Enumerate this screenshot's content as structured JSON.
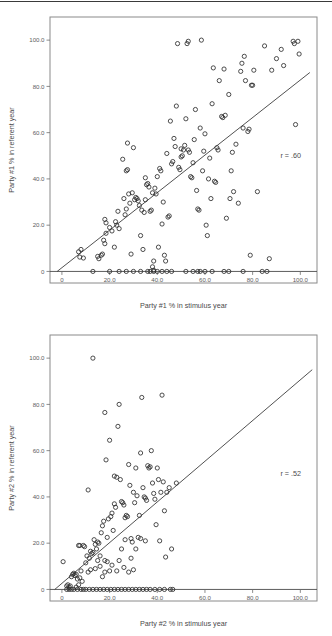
{
  "page": {
    "rule_visible": true
  },
  "chart_data": [
    {
      "id": "chart1",
      "type": "scatter",
      "title": "",
      "xlabel": "Party #1 % in stimulus year",
      "ylabel": "Party #1 % in referent year",
      "annotation": "r = .60",
      "correlation": 0.6,
      "xlim": [
        -5,
        107
      ],
      "ylim": [
        -5,
        110
      ],
      "xticks": [
        0,
        20,
        40,
        60,
        80,
        100
      ],
      "xticklabels": [
        "0",
        "20.0",
        "40.0",
        "60.0",
        "80.0",
        "100.0"
      ],
      "yticks": [
        0,
        20,
        40,
        60,
        80,
        100
      ],
      "yticklabels": [
        "0",
        "20.0",
        "40.0",
        "60.0",
        "80.0",
        "100.0"
      ],
      "grid": false,
      "legend": "none",
      "fit_line": {
        "x0": -2.0,
        "y0": 0.0,
        "x1": 104.0,
        "y1": 86.0
      },
      "marker": "open-circle",
      "points": [
        [
          7.0,
          8.5
        ],
        [
          7.5,
          6.2
        ],
        [
          8.0,
          9.5
        ],
        [
          9.0,
          5.8
        ],
        [
          15.0,
          6.5
        ],
        [
          15.5,
          5.5
        ],
        [
          16.5,
          7.0
        ],
        [
          17.0,
          7.5
        ],
        [
          17.5,
          13.5
        ],
        [
          18.0,
          12.0
        ],
        [
          18.5,
          16.5
        ],
        [
          18.0,
          22.5
        ],
        [
          18.5,
          21.0
        ],
        [
          20.0,
          19.0
        ],
        [
          21.0,
          17.5
        ],
        [
          22.0,
          10.5
        ],
        [
          22.5,
          21.5
        ],
        [
          23.0,
          20.0
        ],
        [
          23.5,
          26.0
        ],
        [
          24.0,
          18.5
        ],
        [
          25.5,
          48.5
        ],
        [
          26.0,
          31.5
        ],
        [
          26.5,
          24.5
        ],
        [
          27.0,
          27.0
        ],
        [
          27.5,
          55.5
        ],
        [
          27.0,
          43.5
        ],
        [
          27.5,
          44.0
        ],
        [
          28.0,
          33.5
        ],
        [
          28.5,
          29.5
        ],
        [
          29.0,
          7.5
        ],
        [
          29.5,
          34.0
        ],
        [
          30.0,
          53.5
        ],
        [
          30.5,
          31.0
        ],
        [
          31.0,
          32.0
        ],
        [
          31.5,
          31.5
        ],
        [
          32.0,
          30.5
        ],
        [
          32.5,
          28.5
        ],
        [
          33.0,
          15.5
        ],
        [
          33.5,
          26.5
        ],
        [
          34.0,
          9.5
        ],
        [
          34.5,
          25.5
        ],
        [
          35.0,
          40.5
        ],
        [
          35.5,
          37.5
        ],
        [
          35.0,
          31.0
        ],
        [
          36.0,
          38.0
        ],
        [
          36.5,
          36.5
        ],
        [
          37.0,
          26.0
        ],
        [
          37.5,
          26.5
        ],
        [
          38.0,
          34.0
        ],
        [
          38.5,
          4.5
        ],
        [
          38.0,
          2.0
        ],
        [
          38.5,
          0.5
        ],
        [
          39.0,
          36.0
        ],
        [
          39.5,
          33.5
        ],
        [
          40.0,
          41.0
        ],
        [
          40.5,
          10.5
        ],
        [
          41.0,
          44.5
        ],
        [
          41.5,
          43.5
        ],
        [
          42.0,
          20.5
        ],
        [
          42.5,
          30.0
        ],
        [
          43.0,
          7.0
        ],
        [
          43.5,
          4.5
        ],
        [
          44.0,
          51.0
        ],
        [
          44.5,
          23.5
        ],
        [
          45.0,
          24.0
        ],
        [
          45.5,
          65.0
        ],
        [
          46.0,
          46.5
        ],
        [
          46.5,
          47.5
        ],
        [
          47.0,
          57.5
        ],
        [
          47.5,
          54.0
        ],
        [
          48.0,
          71.5
        ],
        [
          48.5,
          98.5
        ],
        [
          49.0,
          45.0
        ],
        [
          49.5,
          44.0
        ],
        [
          50.0,
          53.0
        ],
        [
          50.5,
          50.0
        ],
        [
          50.0,
          49.5
        ],
        [
          51.0,
          52.5
        ],
        [
          51.5,
          54.5
        ],
        [
          52.0,
          66.0
        ],
        [
          52.5,
          98.5
        ],
        [
          53.0,
          99.5
        ],
        [
          53.5,
          51.5
        ],
        [
          53.0,
          52.5
        ],
        [
          54.0,
          41.0
        ],
        [
          54.5,
          40.5
        ],
        [
          55.0,
          47.0
        ],
        [
          55.5,
          57.0
        ],
        [
          56.0,
          70.0
        ],
        [
          56.5,
          35.0
        ],
        [
          57.0,
          27.0
        ],
        [
          57.5,
          26.5
        ],
        [
          58.0,
          62.0
        ],
        [
          58.5,
          100.0
        ],
        [
          59.0,
          43.5
        ],
        [
          59.5,
          52.0
        ],
        [
          60.0,
          59.5
        ],
        [
          60.5,
          20.0
        ],
        [
          61.0,
          15.5
        ],
        [
          61.5,
          40.0
        ],
        [
          62.0,
          49.0
        ],
        [
          62.5,
          31.5
        ],
        [
          63.0,
          72.5
        ],
        [
          63.5,
          88.0
        ],
        [
          64.0,
          39.0
        ],
        [
          64.5,
          38.5
        ],
        [
          65.0,
          53.5
        ],
        [
          65.5,
          52.5
        ],
        [
          66.0,
          82.5
        ],
        [
          67.0,
          67.0
        ],
        [
          67.5,
          66.5
        ],
        [
          68.0,
          87.5
        ],
        [
          68.5,
          67.5
        ],
        [
          69.0,
          23.0
        ],
        [
          70.0,
          76.5
        ],
        [
          70.5,
          31.5
        ],
        [
          71.0,
          43.5
        ],
        [
          71.5,
          51.5
        ],
        [
          72.0,
          34.5
        ],
        [
          73.0,
          55.0
        ],
        [
          74.0,
          29.5
        ],
        [
          75.0,
          86.5
        ],
        [
          75.5,
          90.0
        ],
        [
          76.0,
          62.0
        ],
        [
          76.5,
          93.0
        ],
        [
          77.0,
          82.5
        ],
        [
          78.0,
          60.5
        ],
        [
          78.5,
          61.5
        ],
        [
          79.5,
          80.5
        ],
        [
          80.0,
          80.5
        ],
        [
          80.5,
          87.0
        ],
        [
          82.0,
          34.5
        ],
        [
          79.0,
          7.0
        ],
        [
          85.0,
          97.5
        ],
        [
          87.0,
          5.5
        ],
        [
          88.0,
          87.0
        ],
        [
          90.0,
          92.0
        ],
        [
          92.0,
          96.0
        ],
        [
          93.0,
          89.0
        ],
        [
          97.0,
          99.5
        ],
        [
          97.5,
          98.5
        ],
        [
          99.0,
          99.5
        ],
        [
          99.5,
          94.0
        ],
        [
          98.0,
          63.5
        ],
        [
          24.0,
          0.0
        ],
        [
          27.0,
          0.0
        ],
        [
          30.0,
          0.0
        ],
        [
          33.0,
          0.0
        ],
        [
          36.0,
          0.0
        ],
        [
          37.0,
          0.0
        ],
        [
          38.5,
          0.0
        ],
        [
          40.0,
          0.0
        ],
        [
          42.0,
          0.0
        ],
        [
          44.0,
          0.0
        ],
        [
          46.0,
          0.0
        ],
        [
          52.0,
          0.0
        ],
        [
          55.0,
          0.0
        ],
        [
          57.0,
          0.0
        ],
        [
          58.0,
          0.0
        ],
        [
          60.0,
          0.0
        ],
        [
          63.0,
          0.0
        ],
        [
          68.0,
          0.0
        ],
        [
          70.0,
          0.0
        ],
        [
          76.0,
          0.0
        ],
        [
          84.0,
          0.0
        ],
        [
          86.0,
          0.0
        ],
        [
          13.0,
          0.0
        ],
        [
          20.0,
          0.0
        ]
      ]
    },
    {
      "id": "chart2",
      "type": "scatter",
      "title": "",
      "xlabel": "Party #2 % in stimulus year",
      "ylabel": "Party #2 % in referent year",
      "annotation": "r = .52",
      "correlation": 0.52,
      "xlim": [
        -5,
        107
      ],
      "ylim": [
        -5,
        110
      ],
      "xticks": [
        0,
        20,
        40,
        60,
        80,
        100
      ],
      "xticklabels": [
        "0",
        "20.0",
        "40.0",
        "60.0",
        "80.0",
        "100.0"
      ],
      "yticks": [
        0,
        20,
        40,
        60,
        80,
        100
      ],
      "yticklabels": [
        "0",
        "20.0",
        "40.0",
        "60.0",
        "80.0",
        "100.0"
      ],
      "grid": false,
      "legend": "none",
      "fit_line": {
        "x0": -3.0,
        "y0": 0.0,
        "x1": 105.0,
        "y1": 95.0
      },
      "marker": "open-circle",
      "points": [
        [
          0.5,
          12.0
        ],
        [
          2.0,
          1.5
        ],
        [
          2.5,
          2.0
        ],
        [
          3.0,
          1.0
        ],
        [
          3.5,
          1.5
        ],
        [
          4.0,
          5.5
        ],
        [
          4.5,
          6.5
        ],
        [
          5.0,
          7.0
        ],
        [
          5.5,
          6.0
        ],
        [
          6.0,
          6.5
        ],
        [
          6.5,
          4.5
        ],
        [
          7.0,
          19.0
        ],
        [
          7.5,
          19.0
        ],
        [
          7.5,
          5.0
        ],
        [
          8.0,
          8.0
        ],
        [
          8.5,
          3.5
        ],
        [
          9.0,
          19.0
        ],
        [
          9.5,
          18.5
        ],
        [
          10.0,
          11.5
        ],
        [
          10.5,
          14.5
        ],
        [
          11.0,
          43.0
        ],
        [
          11.5,
          13.5
        ],
        [
          12.0,
          16.5
        ],
        [
          12.5,
          15.5
        ],
        [
          13.0,
          16.0
        ],
        [
          13.5,
          21.5
        ],
        [
          13.0,
          100.0
        ],
        [
          14.0,
          19.5
        ],
        [
          14.5,
          17.5
        ],
        [
          15.0,
          20.5
        ],
        [
          15.5,
          20.0
        ],
        [
          16.0,
          14.5
        ],
        [
          16.5,
          24.5
        ],
        [
          17.0,
          27.5
        ],
        [
          17.5,
          29.5
        ],
        [
          17.0,
          5.5
        ],
        [
          18.0,
          76.5
        ],
        [
          18.5,
          56.0
        ],
        [
          18.0,
          7.5
        ],
        [
          19.0,
          22.5
        ],
        [
          19.5,
          30.5
        ],
        [
          20.0,
          64.5
        ],
        [
          20.5,
          31.5
        ],
        [
          21.0,
          33.0
        ],
        [
          21.5,
          25.5
        ],
        [
          22.0,
          37.0
        ],
        [
          22.5,
          35.5
        ],
        [
          22.0,
          49.0
        ],
        [
          23.0,
          48.5
        ],
        [
          23.5,
          70.5
        ],
        [
          24.0,
          80.0
        ],
        [
          24.5,
          47.5
        ],
        [
          25.0,
          38.0
        ],
        [
          25.5,
          37.5
        ],
        [
          26.0,
          36.5
        ],
        [
          26.5,
          31.0
        ],
        [
          27.0,
          32.0
        ],
        [
          27.5,
          31.5
        ],
        [
          28.0,
          54.0
        ],
        [
          28.5,
          45.0
        ],
        [
          29.0,
          22.0
        ],
        [
          29.5,
          20.5
        ],
        [
          30.0,
          42.0
        ],
        [
          30.5,
          37.5
        ],
        [
          31.0,
          52.5
        ],
        [
          31.5,
          40.5
        ],
        [
          32.0,
          22.5
        ],
        [
          32.5,
          32.0
        ],
        [
          33.0,
          59.0
        ],
        [
          33.5,
          83.0
        ],
        [
          34.0,
          44.0
        ],
        [
          34.5,
          40.0
        ],
        [
          35.0,
          39.5
        ],
        [
          35.5,
          38.5
        ],
        [
          36.0,
          53.5
        ],
        [
          36.5,
          52.5
        ],
        [
          37.0,
          53.0
        ],
        [
          37.5,
          60.0
        ],
        [
          38.0,
          46.0
        ],
        [
          38.5,
          41.5
        ],
        [
          39.0,
          39.0
        ],
        [
          39.5,
          28.0
        ],
        [
          40.0,
          52.5
        ],
        [
          40.5,
          47.5
        ],
        [
          41.0,
          21.0
        ],
        [
          41.5,
          42.0
        ],
        [
          42.0,
          84.0
        ],
        [
          42.5,
          46.5
        ],
        [
          43.0,
          34.0
        ],
        [
          43.5,
          14.0
        ],
        [
          44.0,
          42.0
        ],
        [
          45.0,
          44.0
        ],
        [
          46.0,
          17.5
        ],
        [
          48.0,
          46.0
        ],
        [
          28.0,
          7.5
        ],
        [
          29.0,
          13.5
        ],
        [
          30.0,
          8.5
        ],
        [
          26.0,
          9.5
        ],
        [
          24.0,
          12.5
        ],
        [
          23.0,
          8.0
        ],
        [
          21.0,
          10.5
        ],
        [
          20.0,
          8.0
        ],
        [
          19.0,
          12.0
        ],
        [
          25.0,
          17.5
        ],
        [
          26.5,
          21.5
        ],
        [
          31.0,
          17.5
        ],
        [
          33.0,
          22.0
        ],
        [
          35.0,
          21.0
        ],
        [
          12.0,
          8.5
        ],
        [
          14.0,
          9.0
        ],
        [
          11.0,
          7.5
        ],
        [
          15.0,
          12.5
        ],
        [
          16.0,
          10.0
        ],
        [
          18.0,
          12.5
        ],
        [
          6.0,
          1.0
        ],
        [
          7.0,
          2.0
        ],
        [
          2.0,
          0.0
        ],
        [
          3.0,
          0.0
        ],
        [
          4.0,
          0.0
        ],
        [
          5.0,
          0.0
        ],
        [
          6.5,
          0.0
        ],
        [
          8.0,
          0.0
        ],
        [
          9.0,
          0.0
        ],
        [
          10.0,
          0.0
        ],
        [
          11.5,
          0.0
        ],
        [
          13.0,
          0.0
        ],
        [
          14.5,
          0.0
        ],
        [
          16.0,
          0.0
        ],
        [
          17.5,
          0.0
        ],
        [
          19.0,
          0.0
        ],
        [
          20.5,
          0.0
        ],
        [
          22.0,
          0.0
        ],
        [
          23.5,
          0.0
        ],
        [
          25.0,
          0.0
        ],
        [
          26.5,
          0.0
        ],
        [
          28.0,
          0.0
        ],
        [
          29.5,
          0.0
        ],
        [
          31.0,
          0.0
        ],
        [
          32.5,
          0.0
        ],
        [
          34.0,
          0.0
        ],
        [
          35.5,
          0.0
        ],
        [
          37.0,
          0.0
        ],
        [
          39.0,
          0.0
        ],
        [
          41.0,
          0.0
        ],
        [
          43.0,
          0.0
        ],
        [
          45.5,
          0.0
        ],
        [
          46.5,
          0.0
        ]
      ]
    }
  ]
}
